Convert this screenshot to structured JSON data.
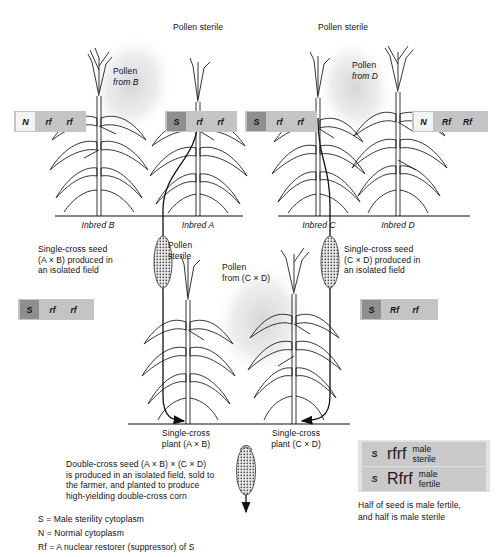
{
  "figure": {
    "type": "diagram"
  },
  "top_labels": {
    "pollen_sterile_left": "Pollen sterile",
    "pollen_sterile_right": "Pollen sterile",
    "pollen_from_b_line1": "Pollen",
    "pollen_from_b_line2": "from B",
    "pollen_from_d_line1": "Pollen",
    "pollen_from_d_line2": "from D"
  },
  "inbred_labels": {
    "b": "Inbred B",
    "a": "Inbred A",
    "c": "Inbred C",
    "d": "Inbred D"
  },
  "genotypes": {
    "inbred_b": {
      "cyto": "N",
      "cyto_type": "N",
      "allele1": "rf",
      "allele2": "rf"
    },
    "inbred_a": {
      "cyto": "S",
      "cyto_type": "S",
      "allele1": "rf",
      "allele2": "rf"
    },
    "inbred_c": {
      "cyto": "S",
      "cyto_type": "S",
      "allele1": "rf",
      "allele2": "rf"
    },
    "inbred_d": {
      "cyto": "N",
      "cyto_type": "N",
      "allele1": "Rf",
      "allele2": "Rf"
    },
    "single_cross_ab": {
      "cyto": "S",
      "cyto_type": "S",
      "allele1": "rf",
      "allele2": "rf"
    },
    "single_cross_cd": {
      "cyto": "S",
      "cyto_type": "S",
      "allele1": "Rf",
      "allele2": "rf"
    }
  },
  "seed_notes": {
    "ab_line1": "Single-cross seed",
    "ab_line2": "(A × B) produced in",
    "ab_line3": "an isolated field",
    "cd_line1": "Single-cross seed",
    "cd_line2": "(C × D) produced in",
    "cd_line3": "an isolated field"
  },
  "mid_labels": {
    "pollen_sterile_line1": "Pollen",
    "pollen_sterile_line2": "sterile",
    "pollen_from_cd_line1": "Pollen",
    "pollen_from_cd_line2": "from (C × D)"
  },
  "plant_labels": {
    "ab_line1": "Single-cross",
    "ab_line2": "plant (A × B)",
    "cd_line1": "Single-cross",
    "cd_line2": "plant (C × D)"
  },
  "double_cross_note": {
    "line1": "Double-cross seed (A × B) × (C × D)",
    "line2": "is produced in an isolated field, sold to",
    "line3": "the farmer, and planted to produce",
    "line4": "high-yielding double-cross corn"
  },
  "legend_key": {
    "s": "S = Male sterility cytoplasm",
    "n": "N = Normal cytoplasm",
    "rf": "Rf = A nuclear restorer (suppressor) of S"
  },
  "legend_panel": {
    "row1": {
      "cyto": "S",
      "allele1": "rf",
      "allele2": "rf",
      "pheno_line1": "male",
      "pheno_line2": "sterile"
    },
    "row2": {
      "cyto": "S",
      "allele1": "Rf",
      "allele2": "rf",
      "pheno_line1": "male",
      "pheno_line2": "fertile"
    },
    "caption_line1": "Half of seed is male fertile,",
    "caption_line2": "and half is male sterile"
  },
  "colors": {
    "box_bg": "#c4c4c4",
    "cyto_s": "#8f8f8f",
    "cyto_n": "#f4f4f4",
    "legend_bg": "#e2e2e2",
    "line": "#111111",
    "pollen_cloud": "#d9d9d9"
  }
}
